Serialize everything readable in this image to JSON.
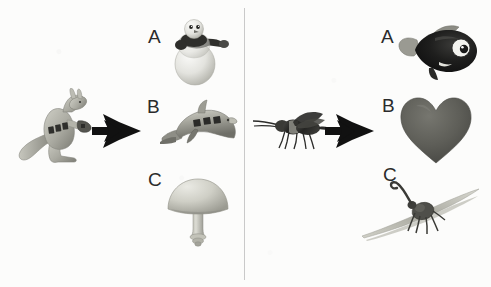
{
  "figure": {
    "type": "visual-analogy-panel",
    "background_color": "#fcfcfb",
    "divider_color": "#c9c9c9",
    "width": 491,
    "height": 287
  },
  "panels": [
    {
      "id": "left-panel",
      "prompt_object": {
        "name": "kangaroo",
        "label": "",
        "colors": [
          "#b9b9ae",
          "#8e8e84",
          "#3a3a36"
        ]
      },
      "arrow": {
        "name": "right-arrow",
        "color": "#111111"
      },
      "choices": [
        {
          "label": "A",
          "name": "snowman",
          "colors": [
            "#e9e9e6",
            "#c9c9c4",
            "#2e2e2c"
          ]
        },
        {
          "label": "B",
          "name": "dolphin",
          "colors": [
            "#a9a9a2",
            "#7f7f78",
            "#2b2b29"
          ]
        },
        {
          "label": "C",
          "name": "mushroom",
          "colors": [
            "#cfcfc6",
            "#a3a39a"
          ]
        }
      ]
    },
    {
      "id": "right-panel",
      "prompt_object": {
        "name": "fly-insect",
        "label": "",
        "colors": [
          "#2a2a28",
          "#6b6b66"
        ]
      },
      "arrow": {
        "name": "right-arrow",
        "color": "#111111"
      },
      "choices": [
        {
          "label": "A",
          "name": "fish",
          "colors": [
            "#1c1c1c",
            "#8c8c86",
            "#f2f2ef"
          ]
        },
        {
          "label": "B",
          "name": "heart",
          "colors": [
            "#5e5e5a",
            "#6d6d68"
          ]
        },
        {
          "label": "C",
          "name": "weevil-on-grass",
          "colors": [
            "#4a4a46",
            "#b7b7ae"
          ]
        }
      ]
    }
  ],
  "labels": {
    "left_a": "A",
    "left_b": "B",
    "left_c": "C",
    "right_a": "A",
    "right_b": "B",
    "right_c": "C"
  }
}
